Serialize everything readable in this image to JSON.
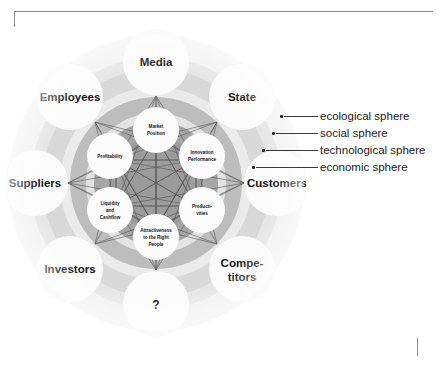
{
  "diagram": {
    "outer_ring": {
      "name": "stakeholders",
      "items": [
        {
          "id": "media",
          "label": "Media",
          "angle": -90
        },
        {
          "id": "state",
          "label": "State",
          "angle": -45
        },
        {
          "id": "customers",
          "label": "Customers",
          "angle": 0
        },
        {
          "id": "competitors",
          "label": "Compe-titors",
          "label_lines": [
            "Compe-",
            "titors"
          ],
          "angle": 45
        },
        {
          "id": "unknown",
          "label": "?",
          "angle": 90
        },
        {
          "id": "investors",
          "label": "Investors",
          "angle": 135
        },
        {
          "id": "suppliers",
          "label": "Suppliers",
          "angle": 180
        },
        {
          "id": "employees",
          "label": "Employees",
          "angle": -135
        }
      ]
    },
    "inner_ring": {
      "name": "performance drivers",
      "items": [
        {
          "id": "market-position",
          "label_lines": [
            "Market",
            "Position"
          ],
          "angle": -90
        },
        {
          "id": "innovation-performance",
          "label_lines": [
            "Innovation",
            "Performance"
          ],
          "angle": -30
        },
        {
          "id": "productivities",
          "label_lines": [
            "Producti-",
            "vities"
          ],
          "angle": 30
        },
        {
          "id": "attractiveness",
          "label_lines": [
            "Attractiveness",
            "to the Right",
            "People"
          ],
          "angle": 90
        },
        {
          "id": "liquidity-cashflow",
          "label_lines": [
            "Liquidity",
            "and",
            "Cashflow"
          ],
          "angle": 150
        },
        {
          "id": "profitability",
          "label_lines": [
            "Profitability"
          ],
          "angle": -150
        }
      ]
    },
    "spheres": {
      "ecological": "#efefef",
      "social": "#e0e0e0",
      "technological": "#c9c9c9",
      "economic": "#a8a8a8",
      "core": "#9a9a9a",
      "bubble": "#fbfbfb"
    }
  },
  "legend": {
    "name": "sphere legend",
    "items": [
      {
        "id": "ecological-sphere",
        "label": "ecological sphere",
        "line_width": 34,
        "dot_x": 4
      },
      {
        "id": "social-sphere",
        "label": "social sphere",
        "line_width": 32,
        "dot_x": -4
      },
      {
        "id": "technological-sphere",
        "label": "technological sphere",
        "line_width": 38,
        "dot_x": -14
      },
      {
        "id": "economic-sphere",
        "label": "economic sphere",
        "line_width": 40,
        "dot_x": -22
      }
    ]
  }
}
